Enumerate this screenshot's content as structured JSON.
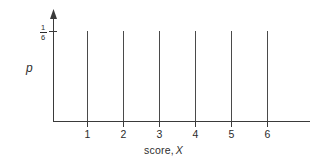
{
  "figure": {
    "background_color": "#ffffff",
    "ink_color": "#3a3a3a",
    "width": 323,
    "height": 160
  },
  "axes": {
    "y_axis_label": "p",
    "y_tick_label": {
      "numerator": "1",
      "denominator": "6"
    },
    "x_axis_label_text": "score,",
    "x_axis_label_variable": "X",
    "x_tick_labels": [
      "1",
      "2",
      "3",
      "4",
      "5",
      "6"
    ]
  },
  "chart_data": {
    "type": "bar",
    "title": "",
    "subtitle": "",
    "xlabel": "score, X",
    "ylabel": "p",
    "categories": [
      "1",
      "2",
      "3",
      "4",
      "5",
      "6"
    ],
    "values": [
      0.1667,
      0.1667,
      0.1667,
      0.1667,
      0.1667,
      0.1667
    ],
    "value_labels": [
      "1/6",
      "1/6",
      "1/6",
      "1/6",
      "1/6",
      "1/6"
    ],
    "series": [
      {
        "name": "p",
        "values": [
          0.1667,
          0.1667,
          0.1667,
          0.1667,
          0.1667,
          0.1667
        ]
      }
    ],
    "xlim": [
      0,
      7
    ],
    "ylim": [
      0,
      0.2
    ],
    "ytick_values": [
      0.1667
    ],
    "ytick_labels": [
      "1/6"
    ],
    "xtick_values": [
      1,
      2,
      3,
      4,
      5,
      6
    ],
    "xtick_labels": [
      "1",
      "2",
      "3",
      "4",
      "5",
      "6"
    ],
    "grid": false,
    "legend": false,
    "legend_position": "none",
    "annotations": []
  }
}
